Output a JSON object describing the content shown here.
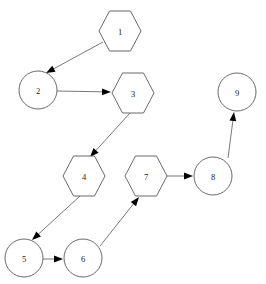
{
  "diagram": {
    "background_color": "#ffffff",
    "node_stroke_color": "#58585a",
    "edge_stroke_color": "#6a6a6c",
    "arrowhead_color": "#000000",
    "label_color": "#1a1a1a",
    "nodes": [
      {
        "id": "1",
        "label": "1",
        "shape": "hexagon",
        "cx": 120,
        "cy": 31,
        "rx": 21,
        "ry": 20
      },
      {
        "id": "2",
        "label": "2",
        "shape": "circle",
        "cx": 38,
        "cy": 90,
        "rx": 19,
        "ry": 19
      },
      {
        "id": "3",
        "label": "3",
        "shape": "hexagon",
        "cx": 133,
        "cy": 93,
        "rx": 21,
        "ry": 20
      },
      {
        "id": "4",
        "label": "4",
        "shape": "hexagon",
        "cx": 84,
        "cy": 176,
        "rx": 21,
        "ry": 20
      },
      {
        "id": "5",
        "label": "5",
        "shape": "circle",
        "cx": 24,
        "cy": 258,
        "rx": 19,
        "ry": 19
      },
      {
        "id": "6",
        "label": "6",
        "shape": "circle",
        "cx": 83,
        "cy": 258,
        "rx": 19,
        "ry": 19
      },
      {
        "id": "7",
        "label": "7",
        "shape": "hexagon",
        "cx": 146,
        "cy": 176,
        "rx": 21,
        "ry": 20
      },
      {
        "id": "8",
        "label": "8",
        "shape": "circle",
        "cx": 213,
        "cy": 176,
        "rx": 19,
        "ry": 19
      },
      {
        "id": "9",
        "label": "9",
        "shape": "circle",
        "cx": 237,
        "cy": 92,
        "rx": 19,
        "ry": 19
      }
    ],
    "edges": [
      {
        "id": "edge-1-2",
        "from": "1",
        "to": "2",
        "x1": 103,
        "y1": 42,
        "x2": 46,
        "y2": 73
      },
      {
        "id": "edge-2-3",
        "from": "2",
        "to": "3",
        "x1": 57,
        "y1": 91,
        "x2": 111,
        "y2": 92
      },
      {
        "id": "edge-3-4",
        "from": "3",
        "to": "4",
        "x1": 130,
        "y1": 113,
        "x2": 90,
        "y2": 157
      },
      {
        "id": "edge-4-5",
        "from": "4",
        "to": "5",
        "x1": 80,
        "y1": 196,
        "x2": 32,
        "y2": 240
      },
      {
        "id": "edge-5-6",
        "from": "5",
        "to": "6",
        "x1": 43,
        "y1": 259,
        "x2": 63,
        "y2": 259
      },
      {
        "id": "edge-6-7",
        "from": "6",
        "to": "7",
        "x1": 100,
        "y1": 246,
        "x2": 139,
        "y2": 197
      },
      {
        "id": "edge-7-8",
        "from": "7",
        "to": "8",
        "x1": 167,
        "y1": 176,
        "x2": 193,
        "y2": 176
      },
      {
        "id": "edge-8-9",
        "from": "8",
        "to": "9",
        "x1": 228,
        "y1": 158,
        "x2": 234,
        "y2": 112
      }
    ]
  }
}
